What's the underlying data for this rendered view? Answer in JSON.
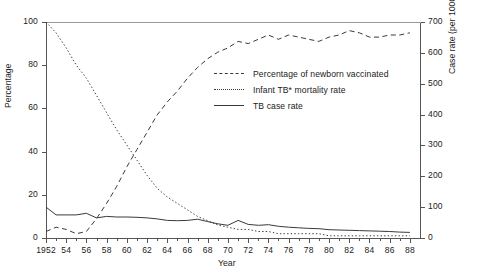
{
  "topnote": "",
  "legend": {
    "position": "inside-center",
    "items": [
      {
        "key": "dashed",
        "label": "Percentage of newborn vaccinated",
        "name": "legend-item-vaccinated"
      },
      {
        "key": "dotted",
        "label": "Infant TB* mortality rate",
        "name": "legend-item-infant-mortality"
      },
      {
        "key": "solid",
        "label": "TB case rate",
        "name": "legend-item-tb-case-rate"
      }
    ]
  },
  "chart_data": {
    "type": "line",
    "title": "",
    "xlabel": "Year",
    "ylabel": "Percentage",
    "ylabel_right": "Case rate (per 100000 population)",
    "xlim": [
      1952,
      1989
    ],
    "ylim": [
      0,
      100
    ],
    "ylim_right": [
      0,
      700
    ],
    "yticks": [
      0,
      20,
      40,
      60,
      80,
      100
    ],
    "yticks_right": [
      0,
      100,
      200,
      300,
      400,
      500,
      600,
      700
    ],
    "xticks": [
      1952,
      1954,
      1956,
      1958,
      1960,
      1962,
      1964,
      1966,
      1968,
      1970,
      1972,
      1974,
      1976,
      1978,
      1980,
      1982,
      1984,
      1986,
      1988
    ],
    "xtick_labels": [
      "1952",
      "54",
      "56",
      "58",
      "60",
      "62",
      "64",
      "66",
      "68",
      "70",
      "72",
      "74",
      "76",
      "78",
      "80",
      "82",
      "84",
      "86",
      "88"
    ],
    "grid": false,
    "x": [
      1952,
      1953,
      1954,
      1955,
      1956,
      1957,
      1958,
      1959,
      1960,
      1961,
      1962,
      1963,
      1964,
      1965,
      1966,
      1967,
      1968,
      1969,
      1970,
      1971,
      1972,
      1973,
      1974,
      1975,
      1976,
      1977,
      1978,
      1979,
      1980,
      1981,
      1982,
      1983,
      1984,
      1985,
      1986,
      1987,
      1988
    ],
    "series": [
      {
        "name": "Percentage of newborn vaccinated",
        "style": "dashed",
        "axis": "left",
        "units": "%",
        "values": [
          3,
          5,
          4,
          2,
          3,
          9,
          16,
          24,
          33,
          41,
          49,
          57,
          63,
          68,
          74,
          79,
          83,
          86,
          88,
          91,
          90,
          92,
          94,
          92,
          94,
          93,
          92,
          91,
          93,
          94,
          96,
          95,
          93,
          93,
          94,
          94,
          95
        ]
      },
      {
        "name": "Infant TB* mortality rate",
        "style": "dotted",
        "axis": "left",
        "units": "%",
        "values": [
          100,
          95,
          88,
          80,
          74,
          66,
          58,
          50,
          43,
          36,
          29,
          23,
          19,
          16,
          13,
          10,
          8,
          6,
          5,
          4,
          4,
          3,
          3,
          2,
          2,
          2,
          2,
          2,
          1,
          1,
          1,
          1,
          1,
          1,
          1,
          1,
          1
        ]
      },
      {
        "name": "TB case rate",
        "style": "solid",
        "axis": "right",
        "units": "per 100000 population",
        "values": [
          100,
          75,
          75,
          75,
          80,
          65,
          70,
          68,
          68,
          67,
          65,
          62,
          57,
          56,
          57,
          61,
          53,
          46,
          41,
          57,
          44,
          41,
          43,
          38,
          35,
          33,
          31,
          30,
          27,
          26,
          25,
          24,
          23,
          22,
          21,
          19,
          18
        ]
      }
    ]
  }
}
